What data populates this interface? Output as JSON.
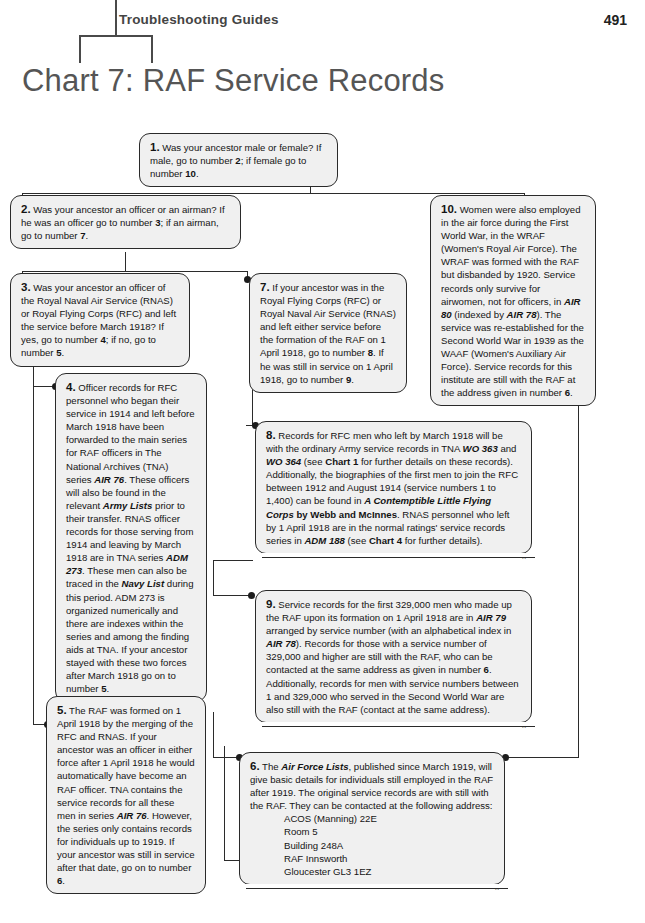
{
  "header": {
    "running_head": "Troubleshooting Guides",
    "page_number": "491"
  },
  "chart_title": "Chart 7: RAF Service Records",
  "chart_data": {
    "type": "diagram",
    "title": "Chart 7: RAF Service Records",
    "nodes": [
      {
        "id": "1",
        "number": "1.",
        "text": "Was your ancestor male or female? If male, go to number 2; if female go to number 10."
      },
      {
        "id": "2",
        "number": "2.",
        "text": "Was your ancestor an officer or an airman? If he was an officer go to number 3; if an airman, go to number 7."
      },
      {
        "id": "3",
        "number": "3.",
        "text": "Was your ancestor an officer of the Royal Naval Air Service (RNAS) or Royal Flying Corps (RFC) and left the service before March 1918? If yes, go to number 4; if no, go to number 5."
      },
      {
        "id": "4",
        "number": "4.",
        "text": "Officer records for RFC personnel who began their service in 1914 and left before March 1918 have been forwarded to the main series for RAF officers in The National Archives (TNA) series AIR 76. These officers will also be found in the relevant Army Lists prior to their transfer. RNAS officer records for those serving from 1914 and leaving by March 1918 are in TNA series ADM 273. These men can also be traced in the Navy List during this period. ADM 273 is organized numerically and there are indexes within the series and among the finding aids at TNA. If your ancestor stayed with these two forces after March 1918 go on to number 5."
      },
      {
        "id": "5",
        "number": "5.",
        "text": "The RAF was formed on 1 April 1918 by the merging of the RFC and RNAS. If your ancestor was an officer in either force after 1 April 1918 he would automatically have become an RAF officer. TNA contains the service records for all these men in series AIR 76. However, the series only contains records for individuals up to 1919. If your ancestor was still in service after that date, go on to number 6."
      },
      {
        "id": "6",
        "number": "6.",
        "text": "The Air Force Lists, published since March 1919, will give basic details for individuals still employed in the RAF after 1919. The original service records are with still with the RAF. They can be contacted at the following address:",
        "address": [
          "ACOS (Manning) 22E",
          "Room 5",
          "Building 248A",
          "RAF Innsworth",
          "Gloucester GL3 1EZ"
        ]
      },
      {
        "id": "7",
        "number": "7.",
        "text": "If your ancestor was in the Royal Flying Corps (RFC) or Royal Naval Air Service (RNAS) and left either service before the formation of the RAF on 1 April 1918, go to number 8. If he was still in service on 1 April 1918, go to number 9."
      },
      {
        "id": "8",
        "number": "8.",
        "text": "Records for RFC men who left by March 1918 will be with the ordinary Army service records in TNA WO 363 and WO 364 (see Chart 1 for further details on these records). Additionally, the biographies of the first men to join the RFC between 1912 and August 1914 (service numbers 1 to 1,400) can be found in A Contemptible Little Flying Corps by Webb and McInnes. RNAS personnel who left by 1 April 1918 are in the normal ratings' service records series in ADM 188 (see Chart 4 for further details)."
      },
      {
        "id": "9",
        "number": "9.",
        "text": "Service records for the first 329,000 men who made up the RAF upon its formation on 1 April 1918 are in AIR 79 arranged by service number (with an alphabetical index in AIR 78). Records for those with a service number of 329,000 and higher are still with the RAF, who can be contacted at the same address as given in number 6. Additionally, records for men with service numbers between 1 and 329,000 who served in the Second World War are also still with the RAF (contact at the same address)."
      },
      {
        "id": "10",
        "number": "10.",
        "text": "Women were also employed in the air force during the First World War, in the WRAF (Women's Royal Air Force). The WRAF was formed with the RAF but disbanded by 1920. Service records only survive for airwomen, not for officers, in AIR 80 (indexed by AIR 78). The service was re-established for the Second World War in 1939 as the WAAF (Women's Auxiliary Air Force). Service records for this institute are still with the RAF at the address given in number 6."
      }
    ],
    "edges": [
      {
        "from": "1",
        "to": "2"
      },
      {
        "from": "1",
        "to": "10"
      },
      {
        "from": "2",
        "to": "3"
      },
      {
        "from": "2",
        "to": "7"
      },
      {
        "from": "3",
        "to": "4"
      },
      {
        "from": "3",
        "to": "5"
      },
      {
        "from": "4",
        "to": "5"
      },
      {
        "from": "5",
        "to": "6"
      },
      {
        "from": "7",
        "to": "8"
      },
      {
        "from": "7",
        "to": "9"
      },
      {
        "from": "9",
        "to": "6"
      },
      {
        "from": "10",
        "to": "6"
      }
    ]
  },
  "boxes": {
    "b1": {
      "num": "1.",
      "html": "Was your ancestor male or female? If male, go to number <b>2</b>; if female go to number <b>10</b>."
    },
    "b2": {
      "num": "2.",
      "html": "Was your ancestor an officer or an airman? If he was an officer go to number <b>3</b>; if an airman, go to number <b>7</b>."
    },
    "b3": {
      "num": "3.",
      "html": "Was your ancestor an officer of the Royal Naval Air Service (RNAS) or Royal Flying Corps (RFC) and left the service before March 1918? If yes, go to number <b>4</b>; if no, go to number <b>5</b>."
    },
    "b4": {
      "num": "4.",
      "html": "Officer records for RFC personnel who began their service in 1914 and left before March 1918 have been forwarded to the main series for RAF officers in The National Archives (TNA) series <i>AIR 76</i>. These officers will also be found in the relevant <i>Army Lists</i> prior to their transfer. RNAS officer records for those serving from 1914 and leaving by March 1918 are in TNA series <i>ADM 273</i>. These men can also be traced in the <i>Navy List</i> during this period. ADM 273 is organized numerically and there are indexes within the series and among the finding aids at TNA. If your ancestor stayed with these two forces after March 1918 go on to number <b>5</b>."
    },
    "b5": {
      "num": "5.",
      "html": "The RAF was formed on 1 April 1918 by the merging of the RFC and RNAS. If your ancestor was an officer in either force after 1 April 1918 he would automatically have become an RAF officer. TNA contains the service records for all these men in series <i>AIR 76</i>. However, the series only contains records for individuals up to 1919. If your ancestor was still in service after that date, go on to number <b>6</b>."
    },
    "b6": {
      "num": "6.",
      "html": "The <i>Air Force Lists</i>, published since March 1919, will give basic details for individuals still employed in the RAF after 1919. The original service records are with still with the RAF. They can be contacted at the following address:<span class=\"addr\">ACOS (Manning) 22E</span><span class=\"addr\">Room 5</span><span class=\"addr\">Building 248A</span><span class=\"addr\">RAF Innsworth</span><span class=\"addr\">Gloucester GL3 1EZ</span>"
    },
    "b7": {
      "num": "7.",
      "html": "If your ancestor was in the Royal Flying Corps (RFC) or Royal Naval Air Service (RNAS) and left either service before the formation of the RAF on 1 April 1918, go to number <b>8</b>. If he was still in service on 1 April 1918, go to number <b>9</b>."
    },
    "b8": {
      "num": "8.",
      "html": "Records for RFC men who left by March 1918 will be with the ordinary Army service records in TNA <i>WO 363</i> and <i>WO 364</i> (see <b>Chart 1</b> for further details on these records). Additionally, the biographies of the first men to join the RFC between 1912 and August 1914 (service numbers 1 to 1,400) can be found in <i>A Contemptible Little Flying Corps</i> <b>by Webb and McInnes</b>. RNAS personnel who left by 1 April 1918 are in the normal ratings' service records series in <i>ADM 188</i> (see <b>Chart 4</b> for further details)."
    },
    "b9": {
      "num": "9.",
      "html": "Service records for the first 329,000 men who made up the RAF upon its formation on 1 April 1918 are in <i>AIR 79</i> arranged by service number (with an alphabetical index in <i>AIR 78</i>). Records for those with a service number of 329,000 and higher are still with the RAF, who can be contacted at the same address as given in number <b>6</b>. Additionally, records for men with service numbers between 1 and 329,000 who served in the Second World War are also still with the RAF (contact at the same address)."
    },
    "b10": {
      "num": "10.",
      "html": "Women were also employed in the air force during the First World War, in the WRAF (Women's Royal Air Force). The WRAF was formed with the RAF but disbanded by 1920. Service records only survive for airwomen, not for officers, in <i>AIR 80</i> (indexed by <i>AIR 78</i>). The service was re-established for the Second World War in 1939 as the WAAF (Women's Auxiliary Air Force). Service records for this institute are still with the RAF at the address given in number <b>6</b>."
    }
  },
  "shadow_mark": "x"
}
